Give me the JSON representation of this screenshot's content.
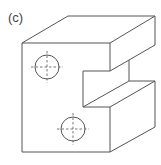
{
  "figure": {
    "label": "(c)",
    "colors": {
      "line": "#555555",
      "background": "#ffffff"
    },
    "holes": [
      {
        "name": "upper-hole",
        "cx": 47,
        "cy": 67,
        "r": 12
      },
      {
        "name": "lower-hole",
        "cx": 73,
        "cy": 129,
        "r": 12
      }
    ]
  }
}
